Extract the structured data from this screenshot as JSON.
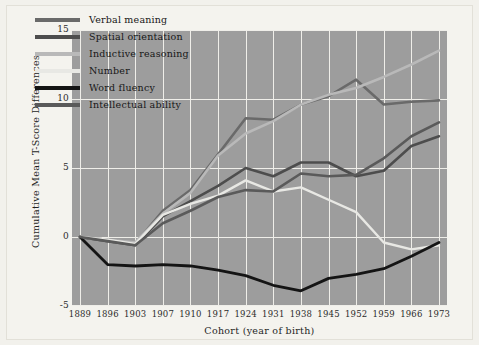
{
  "chart_data": {
    "type": "line",
    "title": "",
    "xlabel": "Cohort (year of birth)",
    "ylabel": "Cumulative Mean T-Score Differences",
    "categories": [
      1889,
      1896,
      1903,
      1907,
      1910,
      1917,
      1924,
      1931,
      1938,
      1945,
      1952,
      1959,
      1966,
      1973
    ],
    "x_tick_labels": [
      "1889",
      "1896",
      "1903",
      "1907",
      "1910",
      "1917",
      "1924",
      "1931",
      "1938",
      "1945",
      "1952",
      "1959",
      "1966",
      "1973"
    ],
    "y_tick_labels": [
      "15",
      "10",
      "5",
      "0",
      "-5"
    ],
    "y_ticks": [
      15,
      10,
      5,
      0,
      -5
    ],
    "ylim": [
      -5,
      15
    ],
    "grid": true,
    "legend_position": "top-left",
    "plot_background": "#9d9d9d",
    "grid_color": "#efeee9",
    "series": [
      {
        "name": "Verbal meaning",
        "color": "#6a6a6a",
        "width": 2.6,
        "values": [
          0,
          -0.2,
          -0.5,
          1.9,
          3.4,
          6.0,
          8.6,
          8.5,
          9.6,
          10.2,
          11.4,
          9.6,
          9.8,
          9.9
        ]
      },
      {
        "name": "Spatial orientation",
        "color": "#4d4d4d",
        "width": 2.6,
        "values": [
          0,
          -0.3,
          -0.6,
          1.5,
          2.6,
          3.7,
          5.0,
          4.4,
          5.4,
          5.4,
          4.4,
          4.8,
          6.6,
          7.3
        ]
      },
      {
        "name": "Inductive reasoning",
        "color": "#b9b9b9",
        "width": 2.6,
        "values": [
          0,
          -0.2,
          -0.4,
          1.7,
          3.2,
          5.9,
          7.5,
          8.4,
          9.6,
          10.3,
          10.8,
          11.6,
          12.5,
          13.5
        ]
      },
      {
        "name": "Number",
        "color": "#e8e8e4",
        "width": 2.4,
        "values": [
          0,
          -0.2,
          -0.5,
          1.6,
          2.4,
          3.0,
          4.1,
          3.3,
          3.6,
          2.7,
          1.8,
          -0.4,
          -0.9,
          -0.6
        ]
      },
      {
        "name": "Word fluency",
        "color": "#141414",
        "width": 2.8,
        "values": [
          0,
          -2.0,
          -2.1,
          -2.0,
          -2.1,
          -2.4,
          -2.8,
          -3.5,
          -3.9,
          -3.0,
          -2.7,
          -2.3,
          -1.4,
          -0.4
        ]
      },
      {
        "name": "Intellectual ability",
        "color": "#5a5a5a",
        "width": 2.6,
        "values": [
          0,
          -0.3,
          -0.6,
          1.0,
          1.9,
          2.9,
          3.4,
          3.3,
          4.6,
          4.4,
          4.5,
          5.7,
          7.3,
          8.3
        ]
      }
    ]
  },
  "legend": {
    "items": [
      {
        "label": "Verbal meaning",
        "color": "#6a6a6a"
      },
      {
        "label": "Spatial orientation",
        "color": "#4d4d4d"
      },
      {
        "label": "Inductive reasoning",
        "color": "#b9b9b9"
      },
      {
        "label": "Number",
        "color": "#e8e8e4"
      },
      {
        "label": "Word fluency",
        "color": "#141414"
      },
      {
        "label": "Intellectual ability",
        "color": "#5a5a5a"
      }
    ]
  }
}
